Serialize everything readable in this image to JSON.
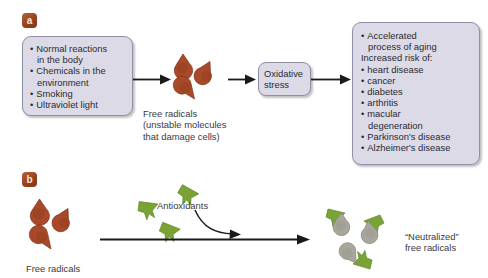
{
  "figure": {
    "background": "#ffffff",
    "panels": [
      {
        "badge": "a",
        "left_box": {
          "title": "",
          "items": [
            {
              "text": "Normal reactions",
              "style": "bulleted"
            },
            {
              "text": "in the body",
              "style": "cont"
            },
            {
              "text": "Chemicals in the",
              "style": "bulleted"
            },
            {
              "text": "environment",
              "style": "cont"
            },
            {
              "text": "Smoking",
              "style": "bulleted"
            },
            {
              "text": "Ultraviolet light",
              "style": "bulleted"
            }
          ]
        },
        "middle_box": {
          "line1": "Oxidative",
          "line2": "stress"
        },
        "right_box": {
          "items": [
            {
              "text": "Accelerated",
              "style": "bulleted"
            },
            {
              "text": "process of aging",
              "style": "cont"
            },
            {
              "text": "Increased risk of:",
              "style": "nobullet"
            },
            {
              "text": "heart disease",
              "style": "bulleted"
            },
            {
              "text": "cancer",
              "style": "bulleted"
            },
            {
              "text": "diabetes",
              "style": "bulleted"
            },
            {
              "text": "arthritis",
              "style": "bulleted"
            },
            {
              "text": "macular",
              "style": "bulleted"
            },
            {
              "text": "degeneration",
              "style": "cont"
            },
            {
              "text": "Parkinson's disease",
              "style": "bulleted"
            },
            {
              "text": "Alzheimer's disease",
              "style": "bulleted"
            }
          ]
        },
        "free_radicals_caption": {
          "line1": "Free radicals",
          "line2": "(unstable molecules",
          "line3": "that damage cells)"
        }
      },
      {
        "badge": "b",
        "free_radicals_label": "Free radicals",
        "antioxidants_label": "Antioxidants",
        "neutralized_label": {
          "line1": "“Neutralized”",
          "line2": "free radicals"
        }
      }
    ],
    "colors": {
      "box_fill": "#dcdae6",
      "box_border": "#8f8fa5",
      "badge_fill": "#9e4a24",
      "badge_text": "#fbe6d2",
      "free_radical_fill": "#a8492a",
      "free_radical_dark": "#8c3a1e",
      "antioxidant_fill": "#7aa336",
      "antioxidant_dark": "#5f8526",
      "neutralized_fill": "#a9a69c",
      "arrow": "#1a1a1a",
      "text": "#2a2a33"
    },
    "icons": {
      "free_radical": "teardrop-shape",
      "antioxidant": "green-arrow-shape",
      "neutralized": "gray-blob-shape"
    }
  }
}
